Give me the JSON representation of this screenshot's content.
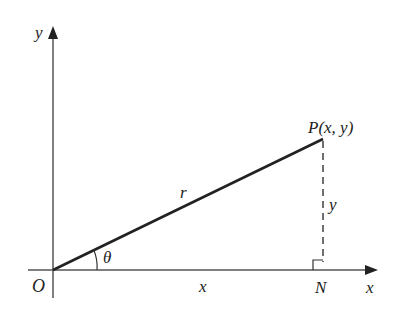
{
  "diagram": {
    "type": "polar-coordinates-triangle",
    "colors": {
      "line": "#222222",
      "axis": "#555555",
      "background": "#ffffff"
    },
    "labels": {
      "y_axis": "y",
      "x_axis": "x",
      "origin": "O",
      "point": "P(x, y)",
      "radius": "r",
      "angle": "θ",
      "horizontal_leg": "x",
      "vertical_leg": "y",
      "foot": "N"
    }
  }
}
